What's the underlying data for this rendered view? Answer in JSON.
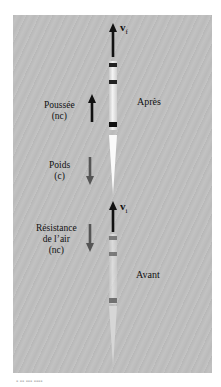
{
  "figure": {
    "type": "physics-diagram",
    "background_color": "#bdbdbd"
  },
  "vectors": {
    "final_velocity": {
      "symbol": "v",
      "subscript": "f",
      "direction": "up"
    },
    "initial_velocity": {
      "symbol": "v",
      "subscript": "i",
      "direction": "up"
    }
  },
  "forces": [
    {
      "name": "Poussée",
      "type": "(nc)",
      "direction": "up",
      "color": "#111111"
    },
    {
      "name": "Poids",
      "type": "(c)",
      "direction": "down",
      "color": "#555555"
    },
    {
      "name": "Résistance",
      "name_line2": "de l’air",
      "type": "(nc)",
      "direction": "down",
      "color": "#555555"
    }
  ],
  "states": {
    "after": "Après",
    "before": "Avant"
  },
  "caption": {
    "text": "▪ ▪▪ ▪▪▪ ▪▪▪▪"
  }
}
